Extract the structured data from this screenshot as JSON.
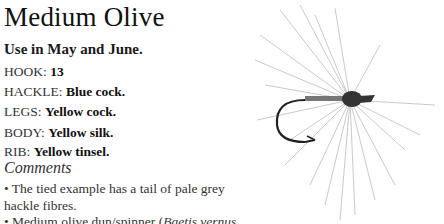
{
  "title": "Medium Olive",
  "usage": "Use in May and June.",
  "specs": [
    {
      "label": "HOOK:",
      "value": "13"
    },
    {
      "label": "HACKLE:",
      "value": "Blue cock."
    },
    {
      "label": "LEGS:",
      "value": "Yellow cock."
    },
    {
      "label": "BODY:",
      "value": "Yellow silk."
    },
    {
      "label": "RIB:",
      "value": "Yellow tinsel."
    }
  ],
  "comments": {
    "heading": "Comments",
    "items": [
      {
        "line1": "• The tied example has a tail of pale grey",
        "line2": "hackle fibres."
      },
      {
        "line1_pre": "• Medium olive dun/spinner (",
        "line1_italic": "Baetis vernus",
        "line1_post": ","
      }
    ]
  },
  "image": {
    "subject": "fly-fishing-fly-illustration"
  }
}
